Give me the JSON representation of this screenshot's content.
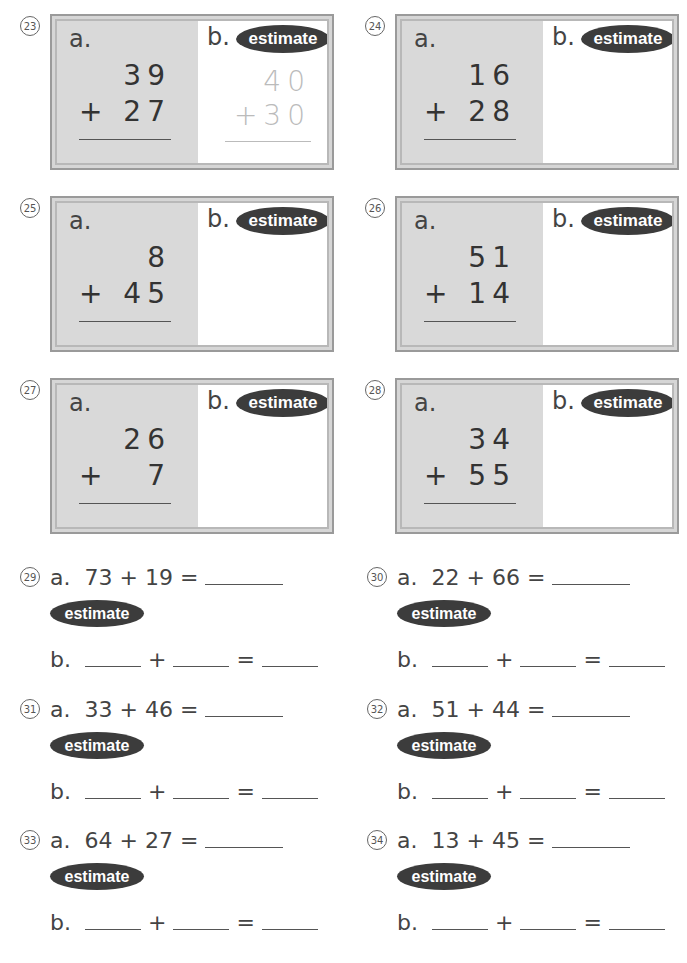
{
  "box_problems": [
    {
      "number": "23",
      "label_a": "a.",
      "top": "39",
      "bottom": "27",
      "operator": "+",
      "label_b": "b.",
      "estimate_label": "estimate",
      "estimate_top": "40",
      "estimate_bottom": "30"
    },
    {
      "number": "24",
      "label_a": "a.",
      "top": "16",
      "bottom": "28",
      "operator": "+",
      "label_b": "b.",
      "estimate_label": "estimate",
      "estimate_top": "",
      "estimate_bottom": ""
    },
    {
      "number": "25",
      "label_a": "a.",
      "top": "8",
      "bottom": "45",
      "operator": "+",
      "label_b": "b.",
      "estimate_label": "estimate",
      "estimate_top": "",
      "estimate_bottom": ""
    },
    {
      "number": "26",
      "label_a": "a.",
      "top": "51",
      "bottom": "14",
      "operator": "+",
      "label_b": "b.",
      "estimate_label": "estimate",
      "estimate_top": "",
      "estimate_bottom": ""
    },
    {
      "number": "27",
      "label_a": "a.",
      "top": "26",
      "bottom": "7",
      "operator": "+",
      "label_b": "b.",
      "estimate_label": "estimate",
      "estimate_top": "",
      "estimate_bottom": ""
    },
    {
      "number": "28",
      "label_a": "a.",
      "top": "34",
      "bottom": "55",
      "operator": "+",
      "label_b": "b.",
      "estimate_label": "estimate",
      "estimate_top": "",
      "estimate_bottom": ""
    }
  ],
  "line_problems": [
    {
      "number": "29",
      "label_a": "a.",
      "equation": "73 + 19 =",
      "estimate_label": "estimate",
      "label_b": "b.",
      "plus": "+",
      "equals": "="
    },
    {
      "number": "30",
      "label_a": "a.",
      "equation": "22 + 66 =",
      "estimate_label": "estimate",
      "label_b": "b.",
      "plus": "+",
      "equals": "="
    },
    {
      "number": "31",
      "label_a": "a.",
      "equation": "33 + 46 =",
      "estimate_label": "estimate",
      "label_b": "b.",
      "plus": "+",
      "equals": "="
    },
    {
      "number": "32",
      "label_a": "a.",
      "equation": "51 + 44 =",
      "estimate_label": "estimate",
      "label_b": "b.",
      "plus": "+",
      "equals": "="
    },
    {
      "number": "33",
      "label_a": "a.",
      "equation": "64 + 27 =",
      "estimate_label": "estimate",
      "label_b": "b.",
      "plus": "+",
      "equals": "="
    },
    {
      "number": "34",
      "label_a": "a.",
      "equation": "13 + 45 =",
      "estimate_label": "estimate",
      "label_b": "b.",
      "plus": "+",
      "equals": "="
    }
  ]
}
